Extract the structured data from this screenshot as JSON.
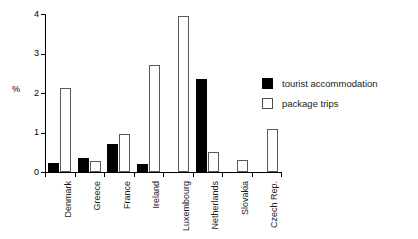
{
  "chart_data": {
    "type": "bar",
    "title": "",
    "subtitle": "",
    "xlabel": "",
    "ylabel": "%",
    "ylim": [
      0,
      4
    ],
    "yticks": [
      0,
      1,
      2,
      3,
      4
    ],
    "ytick_labels": [
      "0",
      "1",
      "2",
      "3",
      "4"
    ],
    "grid": false,
    "legend_position": "right",
    "categories": [
      "Denmark",
      "Greece",
      "France",
      "Ireland",
      "Luxembourg",
      "Netherlands",
      "Slovakia",
      "Czech Rep."
    ],
    "series": [
      {
        "name": "tourist accommodation",
        "style": "solid-black",
        "values": [
          0.22,
          0.35,
          0.7,
          0.2,
          0.0,
          2.35,
          0.0,
          0.0
        ]
      },
      {
        "name": "package trips",
        "style": "hollow-white",
        "values": [
          2.12,
          0.28,
          0.95,
          2.7,
          3.95,
          0.5,
          0.3,
          1.1
        ]
      }
    ]
  },
  "legend": {
    "items": [
      {
        "label": "tourist accommodation",
        "swatch": "solid"
      },
      {
        "label": "package trips",
        "swatch": "hollow"
      }
    ]
  },
  "colors": {
    "axis": "#000000",
    "solid_bar": "#000000",
    "hollow_bar_border": "#58595b",
    "background": "#ffffff",
    "text": "#1a1a1a"
  }
}
